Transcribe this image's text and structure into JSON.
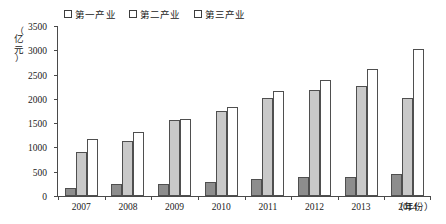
{
  "chart_data": {
    "type": "bar",
    "title": "",
    "xlabel": "（年份）",
    "ylabel": "（亿元）",
    "categories": [
      "2007",
      "2008",
      "2009",
      "2010",
      "2011",
      "2012",
      "2013",
      "2014"
    ],
    "series": [
      {
        "name": "第一产业",
        "color": "#8d8d8d",
        "values": [
          160,
          245,
          250,
          295,
          360,
          390,
          390,
          450
        ]
      },
      {
        "name": "第二产业",
        "color": "#c9c9c9",
        "values": [
          915,
          1125,
          1555,
          1760,
          2020,
          2185,
          2270,
          2020
        ]
      },
      {
        "name": "第三产业",
        "color": "#ffffff",
        "values": [
          1175,
          1320,
          1590,
          1840,
          2165,
          2395,
          2620,
          3020
        ]
      }
    ],
    "ylim": [
      0,
      3500
    ],
    "yticks": [
      0,
      500,
      1000,
      1500,
      2000,
      2500,
      3000,
      3500
    ],
    "ytick_labels": [
      "0",
      "500",
      "1000",
      "1500",
      "2000",
      "2500",
      "3000",
      "3500"
    ],
    "grid": false,
    "legend_position": "top-center"
  },
  "axis": {
    "y_unit_paren_open": "（",
    "y_unit_char1": "亿",
    "y_unit_char2": "元",
    "y_unit_paren_close": "）",
    "x_title": "（年份）"
  }
}
